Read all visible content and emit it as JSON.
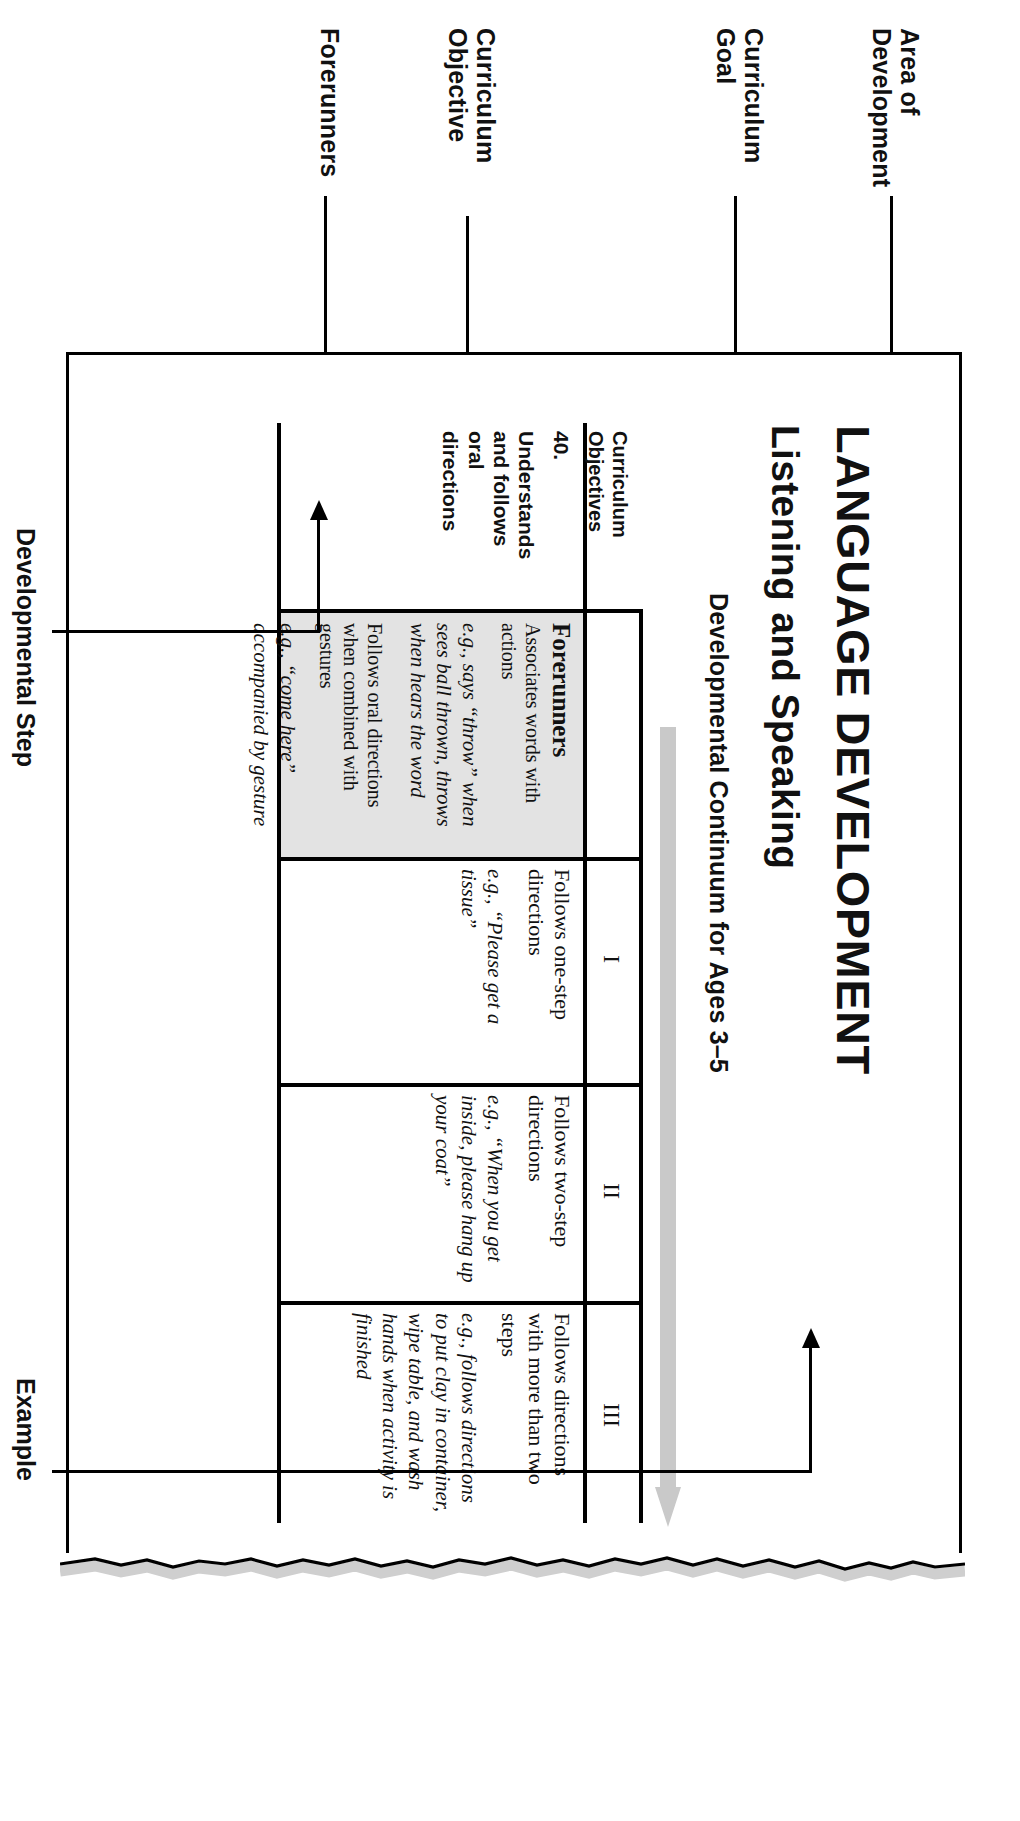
{
  "document": {
    "area_of_development_title": "LANGUAGE DEVELOPMENT",
    "curriculum_goal_title": "Listening and Speaking",
    "continuum_title": "Developmental Continuum for Ages 3–5"
  },
  "annotations": {
    "left": [
      {
        "key": "area",
        "label": "Area of\nDevelopment"
      },
      {
        "key": "goal",
        "label": "Curriculum\nGoal"
      },
      {
        "key": "objective",
        "label": "Curriculum\nObjective"
      },
      {
        "key": "forerunners",
        "label": "Forerunners"
      }
    ],
    "right": [
      {
        "key": "developmental-step",
        "label": "Developmental Step"
      },
      {
        "key": "example",
        "label": "Example"
      }
    ]
  },
  "table": {
    "objectives_header": "Curriculum\nObjectives",
    "step_headers": [
      "I",
      "II",
      "III"
    ],
    "objective": {
      "number": "40.",
      "text": "Understands\nand follows\noral\ndirections"
    },
    "forerunners_cell": {
      "title": "Forerunners",
      "items": [
        {
          "statement": "Associates words with actions",
          "example": "e.g., says “throw” when sees ball thrown, throws when hears the word"
        },
        {
          "statement": "Follows oral directions when combined with gestures",
          "example": "e.g., “come here” accompanied by gesture"
        }
      ]
    },
    "steps": [
      {
        "roman": "I",
        "statement": "Follows one-step directions",
        "example": "e.g., “Please get a tissue”"
      },
      {
        "roman": "II",
        "statement": "Follows two-step directions",
        "example": "e.g., “When you get inside, please hang up your coat”"
      },
      {
        "roman": "III",
        "statement": "Follows directions with more than two steps",
        "example": "e.g., follows directions to put clay in container, wipe table, and wash hands when activity is finished"
      }
    ]
  },
  "colors": {
    "ink": "#111111",
    "rule": "#000000",
    "forerunner_fill": "#e3e3e3",
    "progress_arrow": "#c9c9c9",
    "page_shadow": "#cfcfcf"
  }
}
